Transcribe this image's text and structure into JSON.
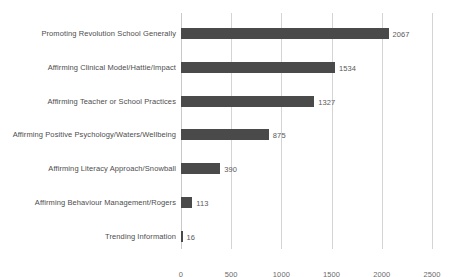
{
  "chart_data": {
    "type": "bar",
    "orientation": "horizontal",
    "title": "",
    "subtitle": "",
    "xlabel": "",
    "ylabel": "",
    "xlim": [
      0,
      2500
    ],
    "xticks": [
      0,
      500,
      1000,
      1500,
      2000,
      2500
    ],
    "xticklabels": [
      "0",
      "500",
      "1000",
      "1500",
      "2000",
      "2500"
    ],
    "grid": true,
    "grid_axis": "x",
    "legend": false,
    "legend_position": "none",
    "bar_color": "#4a4a4a",
    "gridline_color": "#d4d4d4",
    "label_color": "#4d4d4d",
    "value_label_color": "#5a5a5a",
    "show_value_labels": true,
    "categories": [
      "Promoting Revolution School Generally",
      "Affirming Clinical Model/Hattie/Impact",
      "Affirming Teacher or School Practices",
      "Affirming Positive Psychology/Waters/Wellbeing",
      "Affirming Literacy Approach/Snowball",
      "Affirming Behaviour Management/Rogers",
      "Trending Information"
    ],
    "values": [
      2067,
      1534,
      1327,
      875,
      390,
      113,
      16
    ],
    "value_labels": [
      "2067",
      "1534",
      "1327",
      "875",
      "390",
      "113",
      "16"
    ]
  }
}
